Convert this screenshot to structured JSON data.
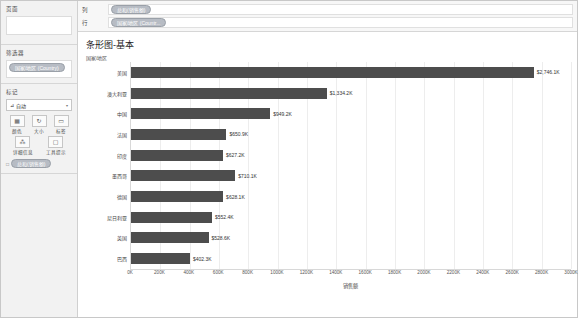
{
  "sidebar": {
    "pages": {
      "title": "页面"
    },
    "filters": {
      "title": "筛选器",
      "pill": "国家/地区 (Country)"
    },
    "marks": {
      "title": "标记",
      "type_label": "自动",
      "type_icon": "bar-mark-icon",
      "caret": "▾",
      "buttons": [
        {
          "name": "color",
          "label": "颜色",
          "icon": "color-icon",
          "glyph": "▦"
        },
        {
          "name": "size",
          "label": "大小",
          "icon": "size-icon",
          "glyph": "↻"
        },
        {
          "name": "label",
          "label": "标签",
          "icon": "label-icon",
          "glyph": "▭"
        },
        {
          "name": "detail",
          "label": "详细信息",
          "icon": "detail-icon",
          "glyph": "⁂"
        },
        {
          "name": "tooltip",
          "label": "工具提示",
          "icon": "tooltip-icon",
          "glyph": "▢"
        }
      ],
      "pill": "总和(销售额)",
      "pill_icon": "□"
    }
  },
  "shelves": [
    {
      "label": "列",
      "pill": "总和(销售额)"
    },
    {
      "label": "行",
      "pill": "国家/地区 (Countr..."
    }
  ],
  "chart_data": {
    "type": "bar",
    "title": "条形图-基本",
    "ylabel": "国家/地区",
    "xlabel": "销售额",
    "categories": [
      "美国",
      "澳大利亚",
      "中国",
      "法国",
      "印度",
      "墨西哥",
      "德国",
      "尼日利亚",
      "英国",
      "巴西"
    ],
    "values": [
      2746.1,
      1334.2,
      949.2,
      650.9,
      627.2,
      710.1,
      628.1,
      552.4,
      528.6,
      402.3
    ],
    "value_labels": [
      "$2,746.1K",
      "$1,334.2K",
      "$949.2K",
      "$650.9K",
      "$627.2K",
      "$710.1K",
      "$628.1K",
      "$552.4K",
      "$528.6K",
      "$402.3K"
    ],
    "xlim": [
      0,
      3000
    ],
    "xticks": [
      0,
      200,
      400,
      600,
      800,
      1000,
      1200,
      1400,
      1600,
      1800,
      2000,
      2200,
      2400,
      2600,
      2800,
      3000
    ],
    "xtick_labels": [
      "0K",
      "200K",
      "400K",
      "600K",
      "800K",
      "1000K",
      "1200K",
      "1400K",
      "1600K",
      "1800K",
      "2000K",
      "2200K",
      "2400K",
      "2600K",
      "2800K",
      "3000K"
    ],
    "bar_color": "#4d4d4d",
    "grid": true,
    "legend": "none"
  }
}
